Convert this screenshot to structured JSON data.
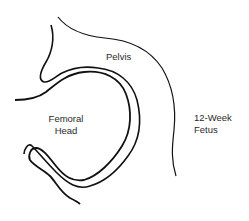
{
  "diagram": {
    "labels": {
      "pelvis": "Pelvis",
      "femoral_head_line1": "Femoral",
      "femoral_head_line2": "Head",
      "fetus_line1": "12-Week",
      "fetus_line2": "Fetus"
    },
    "stroke_color": "#111111"
  }
}
